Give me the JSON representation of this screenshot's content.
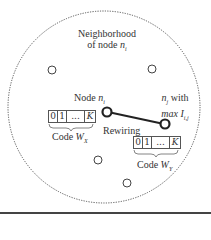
{
  "diagram": {
    "neighborhood_label_line1": "Neighborhood",
    "neighborhood_label_line2_prefix": "of node ",
    "neighborhood_label_var": "n",
    "neighborhood_label_sub": "i",
    "node_i_label_prefix": "Node ",
    "node_i_var": "n",
    "node_i_sub": "i",
    "node_j_var": "n",
    "node_j_sub": "j",
    "node_j_suffix": " with",
    "node_j_line2_max": "max ",
    "node_j_line2_var": "I",
    "node_j_line2_sub": "i,j",
    "edge_label": "Rewiring",
    "code_x": {
      "cells": [
        "0",
        "1",
        "...",
        "K"
      ],
      "label_prefix": "Code ",
      "label_var": "W",
      "label_sub": "X"
    },
    "code_y": {
      "cells": [
        "0",
        "1",
        "...",
        "K"
      ],
      "label_prefix": "Code ",
      "label_var": "W",
      "label_sub": "Y"
    },
    "colors": {
      "stroke": "#333333",
      "dotted_circle": "#555555",
      "bottom_bar": "#444444"
    }
  }
}
